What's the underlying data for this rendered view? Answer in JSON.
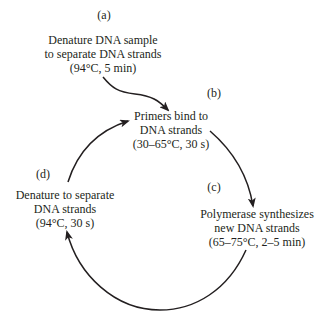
{
  "diagram": {
    "colors": {
      "stroke": "#231f20",
      "text": "#231f20",
      "background": "#ffffff"
    },
    "steps": [
      {
        "id": "a",
        "label": "(a)",
        "lines": [
          "Denature DNA sample",
          "to separate DNA strands",
          "(94°C, 5 min)"
        ]
      },
      {
        "id": "b",
        "label": "(b)",
        "lines": [
          "Primers bind to",
          "DNA strands",
          "(30–65°C, 30 s)"
        ]
      },
      {
        "id": "c",
        "label": "(c)",
        "lines": [
          "Polymerase synthesizes",
          "new DNA strands",
          "(65–75°C, 2–5 min)"
        ]
      },
      {
        "id": "d",
        "label": "(d)",
        "lines": [
          "Denature to separate",
          "DNA strands",
          "(94°C, 30 s)"
        ]
      }
    ],
    "arrows": [
      {
        "from": "a",
        "to": "b"
      },
      {
        "from": "b",
        "to": "c"
      },
      {
        "from": "c",
        "to": "d"
      },
      {
        "from": "d",
        "to": "b"
      }
    ]
  }
}
